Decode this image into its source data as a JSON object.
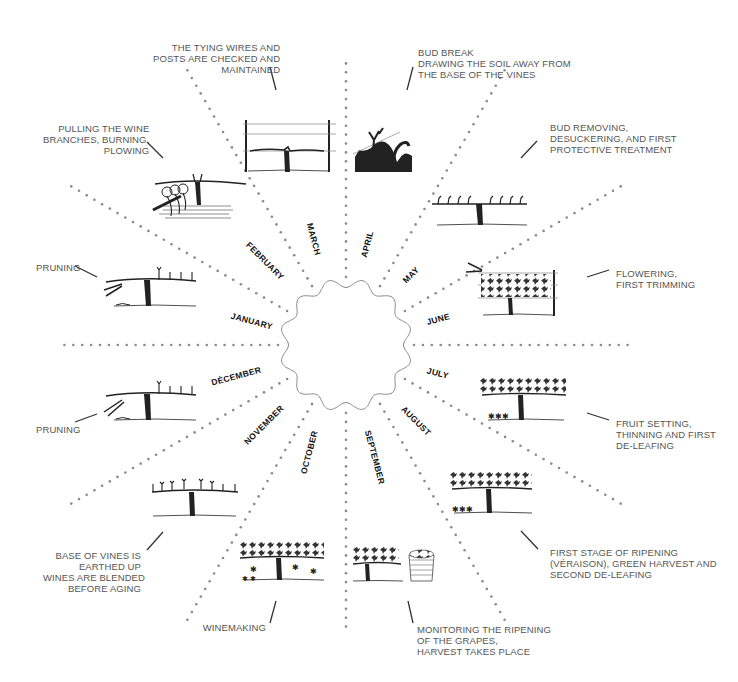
{
  "diagram": {
    "type": "radial-calendar",
    "center": {
      "x": 346,
      "y": 345
    },
    "months": [
      {
        "label": "JANUARY",
        "angle": -165
      },
      {
        "label": "FEBRUARY",
        "angle": -135
      },
      {
        "label": "MARCH",
        "angle": -105
      },
      {
        "label": "APRIL",
        "angle": -75
      },
      {
        "label": "MAY",
        "angle": -45
      },
      {
        "label": "JUNE",
        "angle": -15
      },
      {
        "label": "JULY",
        "angle": 15
      },
      {
        "label": "AUGUST",
        "angle": 45
      },
      {
        "label": "SEPTEMBER",
        "angle": 75
      },
      {
        "label": "OCTOBER",
        "angle": 105
      },
      {
        "label": "NOVEMBER",
        "angle": 135
      },
      {
        "label": "DÉCEMBER",
        "angle": 165
      }
    ],
    "annotations": {
      "january": [
        "PRUNING"
      ],
      "february": [
        "PULLING THE WINE",
        "BRANCHES, BURNING,",
        "PLOWING"
      ],
      "march": [
        "THE TYING WIRES AND",
        "POSTS ARE CHECKED AND",
        "MAINTAINED"
      ],
      "april": [
        "BUD BREAK",
        "DRAWING THE SOIL AWAY FROM",
        "THE BASE OF THE VINES"
      ],
      "may": [
        "BUD REMOVING,",
        "DESUCKERING, AND FIRST",
        "PROTECTIVE TREATMENT"
      ],
      "june": [
        "FLOWERING,",
        "FIRST TRIMMING"
      ],
      "july": [
        "FRUIT SETTING,",
        "THINNING AND FIRST",
        "DE-LEAFING"
      ],
      "august": [
        "FIRST STAGE OF RIPENING",
        "(VÉRAISON), GREEN HARVEST AND",
        "SECOND DE-LEAFING"
      ],
      "september": [
        "MONITORING THE RIPENING",
        "OF THE GRAPES,",
        "HARVEST TAKES PLACE"
      ],
      "october": [
        "WINEMAKING"
      ],
      "november": [
        "BASE OF VINES IS",
        "EARTHED UP",
        "WINES ARE BLENDED",
        "BEFORE AGING"
      ],
      "december": [
        "PRUNING"
      ]
    },
    "illustrations": {
      "january": "pruning-vine-icon",
      "february": "plowing-vine-icon",
      "march": "trellis-wires-icon",
      "april": "soil-drawing-icon",
      "may": "budding-vine-icon",
      "june": "flowering-vine-icon",
      "july": "fruit-setting-vine-icon",
      "august": "veraison-vine-icon",
      "september": "harvest-basket-icon",
      "october": "winemaking-vine-icon",
      "november": "earthed-up-vine-icon",
      "december": "pruning-vine-icon"
    },
    "colors": {
      "dots": "#8a8a8a",
      "ink": "#222222",
      "text": "#555555",
      "month_text": "#111111",
      "circle": "#888888"
    }
  }
}
